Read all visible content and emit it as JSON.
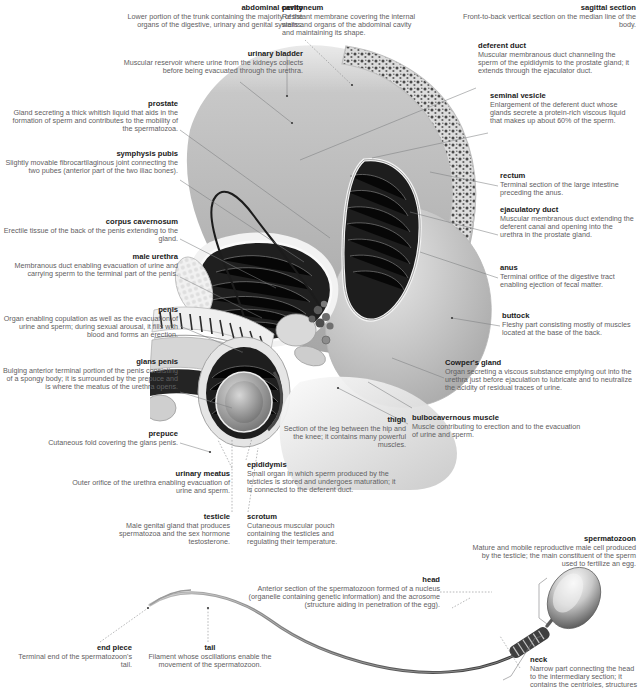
{
  "figure": {
    "views": [
      "sagittal section",
      "spermatozoon"
    ]
  },
  "labels": [
    {
      "id": "abdominal-cavity",
      "title": "abdominal cavity",
      "description": "Lower portion of the trunk containing the majority of the organs of the digestive, urinary and genital systems.",
      "align": "right",
      "x": 118,
      "y": 4,
      "w": 185
    },
    {
      "id": "urinary-bladder",
      "title": "urinary bladder",
      "description": "Muscular reservoir where urine from the kidneys collects before being evacuated through the urethra.",
      "align": "right",
      "x": 122,
      "y": 50,
      "w": 181
    },
    {
      "id": "prostate",
      "title": "prostate",
      "description": "Gland secreting a thick whitish liquid that aids in the formation of sperm and contributes to the mobility of the spermatozoa.",
      "align": "right",
      "x": 8,
      "y": 100,
      "w": 170
    },
    {
      "id": "symphysis-pubis",
      "title": "symphysis pubis",
      "description": "Slightly movable fibrocartilaginous joint connecting the two pubes (anterior part of the two iliac bones).",
      "align": "right",
      "x": 0,
      "y": 150,
      "w": 178
    },
    {
      "id": "corpus-cavernosum",
      "title": "corpus cavernosum",
      "description": "Erectile tissue of the back of the penis extending to the gland.",
      "align": "right",
      "x": 0,
      "y": 218,
      "w": 178
    },
    {
      "id": "male-urethra",
      "title": "male urethra",
      "description": "Membranous duct enabling evacuation of urine and carrying sperm to the terminal part of the penis.",
      "align": "right",
      "x": 12,
      "y": 253,
      "w": 166
    },
    {
      "id": "penis",
      "title": "penis",
      "description": "Organ enabling copulation as well as the evacuation of urine and sperm; during sexual arousal, it fills with blood and forms an erection.",
      "align": "right",
      "x": 0,
      "y": 306,
      "w": 178
    },
    {
      "id": "glans-penis",
      "title": "glans penis",
      "description": "Bulging anterior terminal portion of the penis consisting of a spongy body; it is surrounded by the prepuce and is where the meatus of the urethra opens.",
      "align": "right",
      "x": 0,
      "y": 358,
      "w": 178
    },
    {
      "id": "prepuce",
      "title": "prepuce",
      "description": "Cutaneous fold covering the glans penis.",
      "align": "right",
      "x": 16,
      "y": 430,
      "w": 162
    },
    {
      "id": "urinary-meatus",
      "title": "urinary meatus",
      "description": "Outer orifice of the urethra enabling evacuation of urine and sperm.",
      "align": "right",
      "x": 62,
      "y": 470,
      "w": 168
    },
    {
      "id": "testicle",
      "title": "testicle",
      "description": "Male genital gland that produces spermatozoa and the sex hormone testosterone.",
      "align": "right",
      "x": 84,
      "y": 513,
      "w": 146
    },
    {
      "id": "epididymis",
      "title": "epididymis",
      "description": "Small organ in which sperm produced by the testicles is stored and undergoes maturation; it is connected to the deferent duct.",
      "align": "left",
      "x": 247,
      "y": 461,
      "w": 152
    },
    {
      "id": "scrotum",
      "title": "scrotum",
      "description": "Cutaneous muscular pouch containing the testicles and regulating their temperature.",
      "align": "left",
      "x": 247,
      "y": 513,
      "w": 120
    },
    {
      "id": "thigh",
      "title": "thigh",
      "description": "Section of the leg between the hip and the knee; it contains many powerful muscles.",
      "align": "right",
      "x": 278,
      "y": 416,
      "w": 128
    },
    {
      "id": "peritoneum",
      "title": "peritoneum",
      "description": "Resistant membrane covering the internal walls and organs of the abdominal cavity and maintaining its shape.",
      "align": "left",
      "x": 282,
      "y": 4,
      "w": 142
    },
    {
      "id": "sagittal-section",
      "title": "sagittal section",
      "description": "Front-to-back vertical section on the median line of the body.",
      "align": "right",
      "x": 450,
      "y": 4,
      "w": 186
    },
    {
      "id": "deferent-duct",
      "title": "deferent duct",
      "description": "Muscular membranous duct channeling the sperm of the epididymis to the prostate gland; it extends through the ejaculator duct.",
      "align": "left",
      "x": 478,
      "y": 42,
      "w": 158
    },
    {
      "id": "seminal-vesicle",
      "title": "seminal vesicle",
      "description": "Enlargement of the deferent duct whose glands secrete a protein-rich viscous liquid that makes up about 60% of the sperm.",
      "align": "left",
      "x": 490,
      "y": 92,
      "w": 146
    },
    {
      "id": "rectum",
      "title": "rectum",
      "description": "Terminal section of the large intestine preceding the anus.",
      "align": "left",
      "x": 500,
      "y": 172,
      "w": 136
    },
    {
      "id": "ejaculatory-duct",
      "title": "ejaculatory duct",
      "description": "Muscular membranous duct extending the deferent canal and opening into the urethra in the prostate gland.",
      "align": "left",
      "x": 500,
      "y": 206,
      "w": 136
    },
    {
      "id": "anus",
      "title": "anus",
      "description": "Terminal orifice of the digestive tract enabling ejection of fecal matter.",
      "align": "left",
      "x": 500,
      "y": 264,
      "w": 136
    },
    {
      "id": "buttock",
      "title": "buttock",
      "description": "Fleshy part consisting mostly of muscles located at the base of the back.",
      "align": "left",
      "x": 502,
      "y": 312,
      "w": 134
    },
    {
      "id": "cowpers-gland",
      "title": "Cowper's gland",
      "description": "Organ secreting a viscous substance emptying out into the urethra just before ejaculation to lubricate and to neutralize the acidity of residual traces of urine.",
      "align": "left",
      "x": 445,
      "y": 359,
      "w": 191
    },
    {
      "id": "bulbocavernous-muscle",
      "title": "bulbocavernous muscle",
      "description": "Muscle contributing to erection and to the evacuation of urine and sperm.",
      "align": "left",
      "x": 412,
      "y": 414,
      "w": 170
    },
    {
      "id": "spermatozoon",
      "title": "spermatozoon",
      "description": "Mature and mobile reproductive male cell produced by the testicle; the main constituent of the sperm used to fertilize an egg.",
      "align": "right",
      "x": 468,
      "y": 535,
      "w": 168
    },
    {
      "id": "head",
      "title": "head",
      "description": "Anterior section of the spermatozoon formed of a nucleus (organelle containing genetic information) and the acrosome (structure aiding in penetration of the egg).",
      "align": "right",
      "x": 240,
      "y": 576,
      "w": 200
    },
    {
      "id": "neck",
      "title": "neck",
      "description": "Narrow part connecting the head to the intermediary section; it contains the centrioles, structures",
      "align": "left",
      "x": 530,
      "y": 656,
      "w": 110
    },
    {
      "id": "end-piece",
      "title": "end piece",
      "description": "Terminal end of the spermatozoon's tail.",
      "align": "right",
      "x": 10,
      "y": 644,
      "w": 122
    },
    {
      "id": "tail",
      "title": "tail",
      "description": "Filament whose oscillations enable the movement of the spermatozoon.",
      "align": "center",
      "x": 140,
      "y": 644,
      "w": 140
    }
  ],
  "colors": {
    "title_text": "#1a1a1a",
    "body_text": "#5f6062",
    "leader_line": "#7d7e80",
    "background": "#ffffff"
  }
}
